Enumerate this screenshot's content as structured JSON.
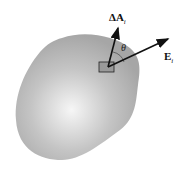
{
  "figure": {
    "labels": {
      "area_vector": {
        "main": "ΔA",
        "sub": "i"
      },
      "field_vector": {
        "main": "E",
        "sub": "i"
      },
      "angle": "θ"
    },
    "colors": {
      "surface_center": "#f4f4f4",
      "surface_edge": "#a8a8a8",
      "arrow": "#111111",
      "patch_fill": "#9a9a9a"
    }
  }
}
